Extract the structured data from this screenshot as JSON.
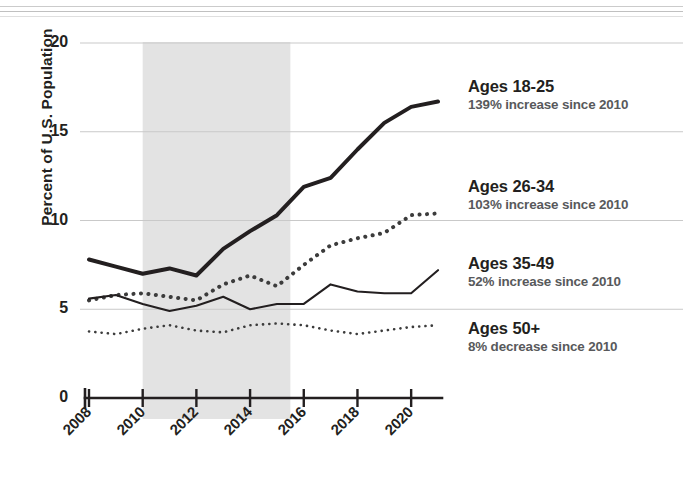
{
  "chart_data": {
    "type": "line",
    "title": "",
    "subtitle": "",
    "xlabel": "",
    "ylabel": "Percent of U.S. Population",
    "xlim": [
      2008,
      2021
    ],
    "ylim": [
      0,
      20
    ],
    "yticks": [
      0,
      5,
      10,
      15,
      20
    ],
    "ytick_labels": [
      "0",
      "5",
      "10",
      "15",
      "20"
    ],
    "xticks": [
      2008,
      2010,
      2012,
      2014,
      2016,
      2018,
      2020
    ],
    "xtick_labels": [
      "2008",
      "2010",
      "2012",
      "2014",
      "2016",
      "2018",
      "2020"
    ],
    "grid": "horizontal gridlines at 5, 10, 15, 20",
    "legend_position": "right",
    "shaded_band": {
      "label": "",
      "x_start": 2010,
      "x_end": 2015.5,
      "color": "#e3e3e3"
    },
    "x": [
      2008,
      2009,
      2010,
      2011,
      2012,
      2013,
      2014,
      2015,
      2016,
      2017,
      2018,
      2019,
      2020,
      2021
    ],
    "series": [
      {
        "name": "Ages 18-25",
        "style": "solid-thick",
        "color": "#231f20",
        "values": [
          7.8,
          7.4,
          7.0,
          7.3,
          6.9,
          8.4,
          9.4,
          10.3,
          11.9,
          12.4,
          14.0,
          15.5,
          16.4,
          16.7
        ]
      },
      {
        "name": "Ages 26-34",
        "style": "dotted-thick",
        "color": "#3c3c3c",
        "values": [
          5.5,
          5.8,
          5.9,
          5.7,
          5.5,
          6.4,
          6.9,
          6.3,
          7.5,
          8.6,
          9.0,
          9.3,
          10.3,
          10.4
        ]
      },
      {
        "name": "Ages 35-49",
        "style": "solid-thin",
        "color": "#231f20",
        "values": [
          5.6,
          5.8,
          5.3,
          4.9,
          5.2,
          5.7,
          5.0,
          5.3,
          5.3,
          6.4,
          6.0,
          5.9,
          5.9,
          7.2
        ]
      },
      {
        "name": "Ages 50+",
        "style": "dotted-thin",
        "color": "#3c3c3c",
        "values": [
          3.75,
          3.6,
          3.9,
          4.1,
          3.8,
          3.7,
          4.1,
          4.2,
          4.1,
          3.8,
          3.6,
          3.8,
          4.0,
          4.1
        ]
      }
    ]
  },
  "legend": {
    "items": [
      {
        "title": "Ages 18-25",
        "sub": "139% increase since 2010"
      },
      {
        "title": "Ages 26-34",
        "sub": "103% increase since 2010"
      },
      {
        "title": "Ages 35-49",
        "sub": "52% increase since 2010"
      },
      {
        "title": "Ages 50+",
        "sub": "8% decrease since 2010"
      }
    ]
  }
}
